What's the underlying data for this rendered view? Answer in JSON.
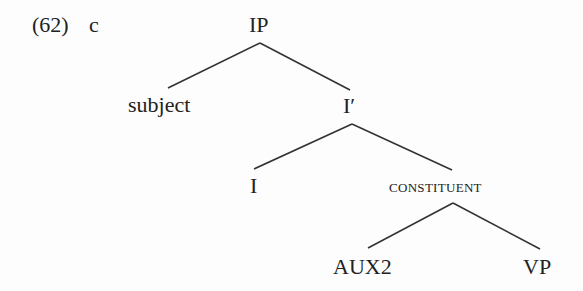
{
  "example": {
    "number": "(62)",
    "sublabel": "c"
  },
  "tree": {
    "nodes": {
      "ip": "IP",
      "subject": "subject",
      "i_bar": "I′",
      "i": "I",
      "constituent": "CONSTITUENT",
      "aux2": "AUX2",
      "vp": "VP"
    },
    "edges": [
      [
        "IP",
        "subject"
      ],
      [
        "IP",
        "I′"
      ],
      [
        "I′",
        "I"
      ],
      [
        "I′",
        "CONSTITUENT"
      ],
      [
        "CONSTITUENT",
        "AUX2"
      ],
      [
        "CONSTITUENT",
        "VP"
      ]
    ]
  }
}
